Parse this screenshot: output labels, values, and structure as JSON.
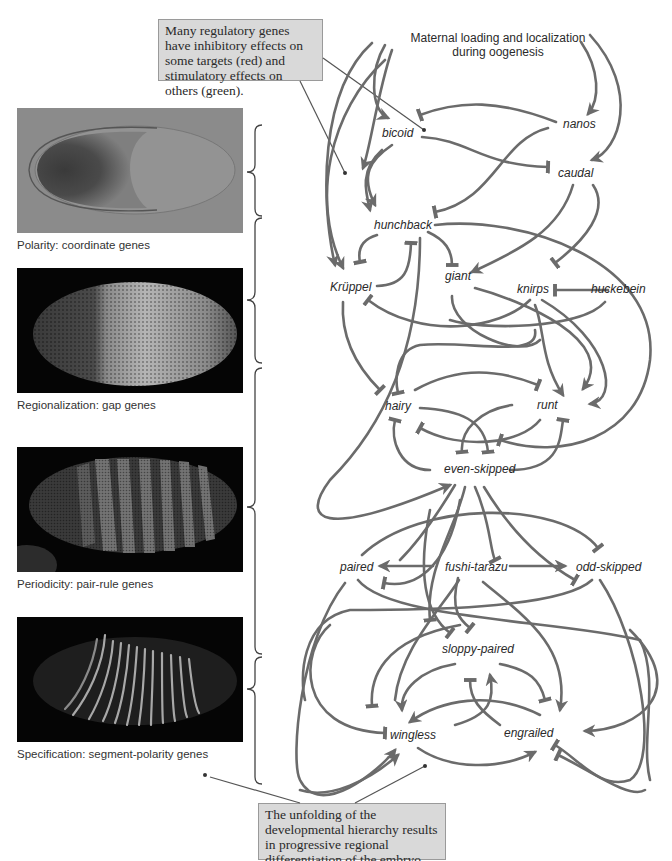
{
  "callouts": {
    "top": "Many regulatory genes have inhibitory effects on some targets (red) and stimulatory effects on others (green).",
    "bottom": "The unfolding of the developmental hierarchy results in progressive regional differentiation of the embryo."
  },
  "maternal_label": {
    "line1": "Maternal loading and localization",
    "line2": "during oogenesis"
  },
  "panels": [
    {
      "caption": "Polarity: coordinate genes",
      "style": "gray-gradient-embryo"
    },
    {
      "caption": "Regionalization: gap genes",
      "style": "dark-fluorescent-embryo"
    },
    {
      "caption": "Periodicity: pair-rule genes",
      "style": "dark-seven-stripes"
    },
    {
      "caption": "Specification: segment-polarity genes",
      "style": "dark-fourteen-stripes"
    }
  ],
  "genes": {
    "bicoid": "bicoid",
    "nanos": "nanos",
    "caudal": "caudal",
    "hunchback": "hunchback",
    "kruppel": "Krüppel",
    "giant": "giant",
    "knirps": "knirps",
    "huckebein": "huckebein",
    "hairy": "hairy",
    "runt": "runt",
    "even_skipped": "even-skipped",
    "paired": "paired",
    "fushi_tarazu": "fushi-tarazu",
    "odd_skipped": "odd-skipped",
    "sloppy_paired": "sloppy-paired",
    "wingless": "wingless",
    "engrailed": "engrailed"
  },
  "colors": {
    "edge": "#6b6b6b",
    "callout_bg": "#d9d9d9",
    "text": "#2a2a2a"
  }
}
